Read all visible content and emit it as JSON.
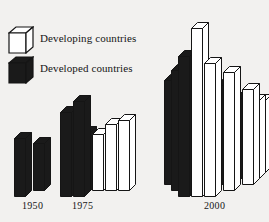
{
  "chart_data": {
    "type": "bar",
    "title": "",
    "subtitle": "",
    "xlabel": "",
    "ylabel": "",
    "grid": false,
    "legend_position": "top-left",
    "orientation": "isometric-3d",
    "categories": [
      "1950",
      "1975",
      "2000"
    ],
    "series": [
      {
        "name": "Developing countries",
        "color": "#ffffff",
        "values": [
          0,
          3,
          18
        ]
      },
      {
        "name": "Developed countries",
        "color": "#1a1a1a",
        "values": [
          2,
          2,
          18
        ]
      }
    ],
    "note": "Bar counts per year group; each bar is one unit. Heights vary within a group forming a stepped pyramid.",
    "groups": [
      {
        "year": "1950",
        "bars": [
          {
            "kind": "developed",
            "col": 0,
            "row": 0,
            "height": 58
          },
          {
            "kind": "developed",
            "col": 1,
            "row": 1,
            "height": 47
          }
        ]
      },
      {
        "year": "1975",
        "bars": [
          {
            "kind": "developed",
            "col": 0,
            "row": 0,
            "height": 84
          },
          {
            "kind": "developed",
            "col": 1,
            "row": 0,
            "height": 95
          },
          {
            "kind": "developed",
            "col": 0,
            "row": 1,
            "height": 58
          },
          {
            "kind": "developed",
            "col": 1,
            "row": 1,
            "height": 58
          },
          {
            "kind": "developing",
            "col": 2,
            "row": 1,
            "height": 56
          },
          {
            "kind": "developing",
            "col": 3,
            "row": 1,
            "height": 66
          },
          {
            "kind": "developing",
            "col": 4,
            "row": 1,
            "height": 70
          }
        ]
      },
      {
        "year": "2000",
        "bars": [
          {
            "kind": "developing",
            "col": 3,
            "row": 0,
            "height": 168
          },
          {
            "kind": "developed",
            "col": 2,
            "row": 0,
            "height": 140
          },
          {
            "kind": "developing",
            "col": 4,
            "row": 0,
            "height": 133
          },
          {
            "kind": "developed",
            "col": 1,
            "row": 1,
            "height": 120
          },
          {
            "kind": "developing",
            "col": 3,
            "row": 1,
            "height": 126
          },
          {
            "kind": "developing",
            "col": 5,
            "row": 1,
            "height": 118
          },
          {
            "kind": "developed",
            "col": 0,
            "row": 2,
            "height": 104
          },
          {
            "kind": "developing",
            "col": 2,
            "row": 2,
            "height": 100
          },
          {
            "kind": "developed",
            "col": 4,
            "row": 2,
            "height": 99
          },
          {
            "kind": "developing",
            "col": 6,
            "row": 2,
            "height": 95
          },
          {
            "kind": "developing",
            "col": 0,
            "row": 3,
            "height": 92
          },
          {
            "kind": "developed",
            "col": 1,
            "row": 3,
            "height": 88
          },
          {
            "kind": "developing",
            "col": 2,
            "row": 3,
            "height": 86
          },
          {
            "kind": "developed",
            "col": 3,
            "row": 3,
            "height": 84
          },
          {
            "kind": "developing",
            "col": 4,
            "row": 3,
            "height": 82
          },
          {
            "kind": "developed",
            "col": 5,
            "row": 3,
            "height": 80
          },
          {
            "kind": "developing",
            "col": 6,
            "row": 3,
            "height": 78
          },
          {
            "kind": "developing",
            "col": 0,
            "row": 4,
            "height": 78
          },
          {
            "kind": "developed",
            "col": 1,
            "row": 4,
            "height": 76
          },
          {
            "kind": "developing",
            "col": 2,
            "row": 4,
            "height": 76
          },
          {
            "kind": "developed",
            "col": 3,
            "row": 4,
            "height": 74
          },
          {
            "kind": "developing",
            "col": 4,
            "row": 4,
            "height": 74
          },
          {
            "kind": "developed",
            "col": 5,
            "row": 4,
            "height": 72
          },
          {
            "kind": "developing",
            "col": 6,
            "row": 4,
            "height": 72
          }
        ]
      }
    ]
  },
  "legend": {
    "items": [
      {
        "label": "Developing countries",
        "swatch": "white-cube-icon"
      },
      {
        "label": "Developed countries",
        "swatch": "black-cube-icon"
      }
    ]
  },
  "axis": {
    "group_labels": [
      "1950",
      "1975",
      "2000"
    ]
  },
  "colors": {
    "background": "#f2f1ef",
    "ink": "#151515",
    "developed_fill": "#1a1a1a",
    "developing_fill": "#ffffff",
    "side_shadow": "#1a1a1a"
  }
}
